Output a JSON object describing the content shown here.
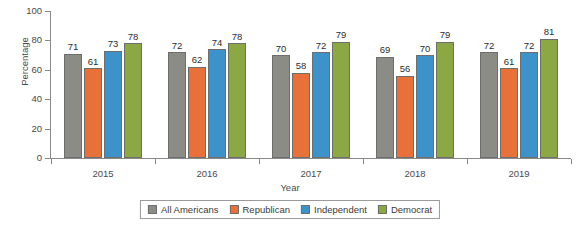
{
  "chart_data": {
    "type": "bar",
    "title": "",
    "xlabel": "Year",
    "ylabel": "Percentage",
    "categories": [
      "2015",
      "2016",
      "2017",
      "2018",
      "2019"
    ],
    "ylim": [
      0,
      100
    ],
    "yticks": [
      0,
      20,
      40,
      60,
      80,
      100
    ],
    "grid": false,
    "legend_position": "bottom",
    "series": [
      {
        "name": "All Americans",
        "color": "#8c8c87",
        "values": [
          71,
          72,
          70,
          69,
          72
        ]
      },
      {
        "name": "Republican",
        "color": "#e8703a",
        "values": [
          61,
          62,
          58,
          56,
          61
        ]
      },
      {
        "name": "Independent",
        "color": "#3d92c9",
        "values": [
          73,
          74,
          72,
          70,
          72
        ]
      },
      {
        "name": "Democrat",
        "color": "#8ca845",
        "values": [
          78,
          78,
          79,
          79,
          81
        ]
      }
    ]
  },
  "axes": {
    "y_title": "Percentage",
    "x_title": "Year",
    "y_ticks": [
      "0",
      "20",
      "40",
      "60",
      "80",
      "100"
    ],
    "x_ticks": [
      "2015",
      "2016",
      "2017",
      "2018",
      "2019"
    ]
  },
  "legend": {
    "items": [
      {
        "label": "All Americans",
        "color": "#8c8c87"
      },
      {
        "label": "Republican",
        "color": "#e8703a"
      },
      {
        "label": "Independent",
        "color": "#3d92c9"
      },
      {
        "label": "Democrat",
        "color": "#8ca845"
      }
    ]
  }
}
